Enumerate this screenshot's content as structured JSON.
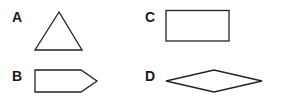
{
  "figure": {
    "stroke_color": "#222222",
    "fill_color": "#ffffff",
    "options": [
      {
        "label": "A",
        "shape": "triangle",
        "shape_name": "equilateral triangle"
      },
      {
        "label": "B",
        "shape": "pentagon",
        "shape_name": "arrow-shaped pentagon pointing right"
      },
      {
        "label": "C",
        "shape": "rectangle",
        "shape_name": "rectangle"
      },
      {
        "label": "D",
        "shape": "rhombus",
        "shape_name": "flat rhombus (diamond)"
      }
    ]
  }
}
